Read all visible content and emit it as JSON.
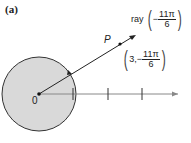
{
  "figure": {
    "part_label": "(a)",
    "origin_label": "0",
    "point_label": "P",
    "ray_label": {
      "prefix": "ray",
      "sign": "−",
      "numerator": "11π",
      "denominator": "6"
    },
    "point_coords": {
      "r": "3,",
      "sign": "−",
      "numerator": "11π",
      "denominator": "6"
    },
    "colors": {
      "disk_fill": "#d9d9d9",
      "line": "#222222",
      "axis": "#888888"
    }
  }
}
